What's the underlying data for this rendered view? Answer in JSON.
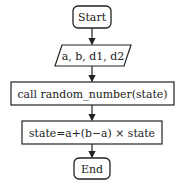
{
  "flowchart": {
    "nodes": [
      {
        "id": "start",
        "shape": "rounded-rect",
        "label": "Start"
      },
      {
        "id": "input",
        "shape": "parallelogram",
        "label": "a, b, d1, d2"
      },
      {
        "id": "call",
        "shape": "rect",
        "label": "call random_number(state)"
      },
      {
        "id": "assign",
        "shape": "rect",
        "label": "state=a+(b−a) × state"
      },
      {
        "id": "end",
        "shape": "rounded-rect",
        "label": "End"
      }
    ],
    "edges": [
      {
        "from": "start",
        "to": "input"
      },
      {
        "from": "input",
        "to": "call"
      },
      {
        "from": "call",
        "to": "assign"
      },
      {
        "from": "assign",
        "to": "end"
      }
    ],
    "colors": {
      "stroke": "#222222",
      "background": "#ffffff"
    }
  }
}
